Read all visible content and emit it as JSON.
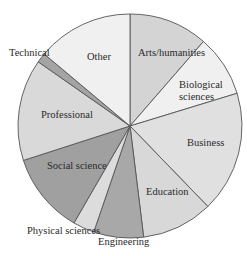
{
  "chart_data": {
    "type": "pie",
    "title": "",
    "start_angle_deg": 0,
    "direction": "clockwise",
    "categories": [
      "Arts/humanities",
      "Biological sciences",
      "Business",
      "Education",
      "Engineering",
      "Physical sciences",
      "Social science",
      "Professional",
      "Technical",
      "Other"
    ],
    "values": [
      11.4,
      8.9,
      17.5,
      10.3,
      7.2,
      3.1,
      11.7,
      14.7,
      1.4,
      13.9
    ],
    "unit": "percent (estimated from slice angles)",
    "colors": [
      "#d4d4d4",
      "#f0f0f0",
      "#e0e0e0",
      "#d8d8d8",
      "#a8a8a8",
      "#dcdcdc",
      "#a0a0a0",
      "#d9d9d9",
      "#a4a4a4",
      "#f0f0f0"
    ],
    "legend": "none (labels placed on/near slices)",
    "grid": false
  },
  "labels": {
    "arts": "Arts/humanities",
    "bio_line1": "Biological",
    "bio_line2": "sciences",
    "business": "Business",
    "education": "Education",
    "engineering": "Engineering",
    "physical": "Physical sciences",
    "social": "Social science",
    "professional": "Professional",
    "technical": "Technical",
    "other": "Other"
  }
}
